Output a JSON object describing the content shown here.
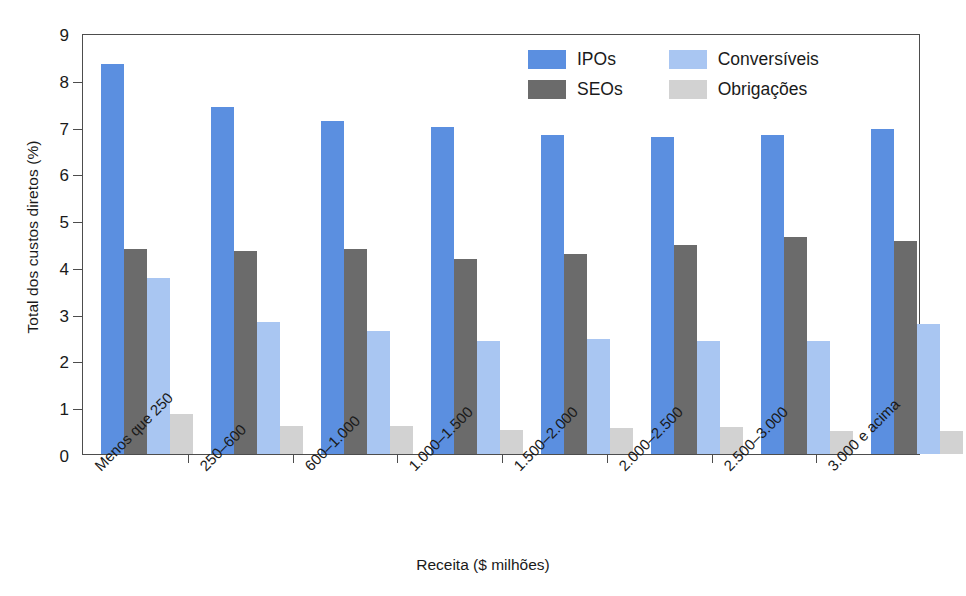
{
  "chart_data": {
    "type": "bar",
    "title": "",
    "subtitle": "",
    "xlabel": "Receita ($ milhões)",
    "ylabel": "Total dos custos diretos (%)",
    "ylim": [
      0,
      9
    ],
    "yticks": [
      0,
      1,
      2,
      3,
      4,
      5,
      6,
      7,
      8,
      9
    ],
    "ytick_labels": [
      "0",
      "1",
      "2",
      "3",
      "4",
      "5",
      "6",
      "7",
      "8",
      "9"
    ],
    "grid": false,
    "legend_position": "top-right-inside",
    "categories": [
      "Menos que 250",
      "250–600",
      "600–1.000",
      "1.000–1.500",
      "1.500–2.000",
      "2.000–2.500",
      "2.500–3.000",
      "3.000 e acima"
    ],
    "series": [
      {
        "name": "IPOs",
        "color": "#5b8fe0",
        "values": [
          8.33,
          7.42,
          7.12,
          6.99,
          6.82,
          6.78,
          6.81,
          6.95
        ]
      },
      {
        "name": "SEOs",
        "color": "#6b6b6b",
        "values": [
          4.38,
          4.33,
          4.38,
          4.16,
          4.28,
          4.47,
          4.63,
          4.56
        ]
      },
      {
        "name": "Conversíveis",
        "color": "#a9c6f2",
        "values": [
          3.77,
          2.82,
          2.64,
          2.42,
          2.46,
          2.42,
          2.41,
          2.77
        ]
      },
      {
        "name": "Obrigações",
        "color": "#d2d2d2",
        "values": [
          0.85,
          0.59,
          0.6,
          0.51,
          0.55,
          0.58,
          0.5,
          0.49
        ]
      }
    ]
  },
  "legend": {
    "entries": [
      {
        "label": "IPOs",
        "color": "#5b8fe0"
      },
      {
        "label": "Conversíveis",
        "color": "#a9c6f2"
      },
      {
        "label": "SEOs",
        "color": "#6b6b6b"
      },
      {
        "label": "Obrigações",
        "color": "#d2d2d2"
      }
    ]
  },
  "axes": {
    "frame_color": "#4d4d4d"
  }
}
